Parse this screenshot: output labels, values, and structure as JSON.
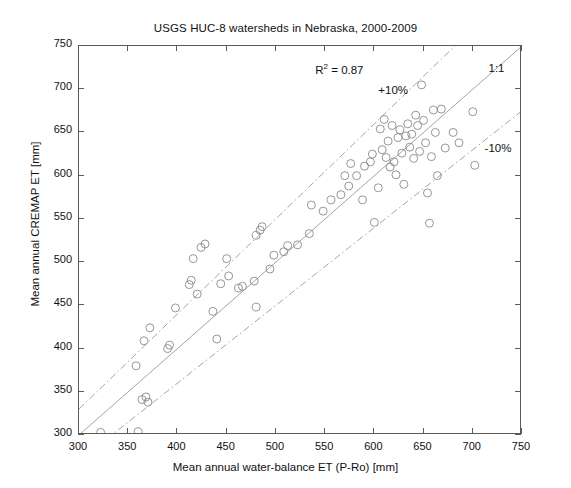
{
  "chart_data": {
    "type": "scatter",
    "title": "USGS HUC-8 watersheds in Nebraska, 2000-2009",
    "xlabel": "Mean annual water-balance ET (P-Ro) [mm]",
    "ylabel": "Mean annual CREMAP ET [mm]",
    "xlim": [
      300,
      750
    ],
    "ylim": [
      300,
      750
    ],
    "xticks": [
      300,
      350,
      400,
      450,
      500,
      550,
      600,
      650,
      700,
      750
    ],
    "yticks": [
      300,
      350,
      400,
      450,
      500,
      550,
      600,
      650,
      700,
      750
    ],
    "grid": false,
    "legend": "none",
    "marker": "open-circle",
    "marker_color": "#8a8a8a",
    "line_color": "#9a9a9a",
    "annotations": [
      {
        "name": "r-squared",
        "text_pre": "R",
        "text_sup": "2",
        "text_post": " = 0.87",
        "x": 540,
        "y": 722
      },
      {
        "name": "plus-ten-percent",
        "text": "+10%",
        "x": 604,
        "y": 697
      },
      {
        "name": "one-to-one",
        "text": "1:1",
        "x": 716,
        "y": 722
      },
      {
        "name": "minus-ten-percent",
        "text": "-10%",
        "x": 712,
        "y": 630
      }
    ],
    "reference_lines": [
      {
        "name": "one-to-one-line",
        "label": "1:1",
        "style": "solid",
        "slope": 1.0,
        "intercept": 0
      },
      {
        "name": "plus-10-percent-line",
        "label": "+10%",
        "style": "dash-dot",
        "slope": 1.1,
        "intercept": 0
      },
      {
        "name": "minus-10-percent-line",
        "label": "-10%",
        "style": "dash-dot",
        "slope": 0.9,
        "intercept": 0
      }
    ],
    "r_squared": 0.87,
    "points": [
      [
        322,
        303
      ],
      [
        360,
        304
      ],
      [
        364,
        341
      ],
      [
        368,
        344
      ],
      [
        370,
        338
      ],
      [
        358,
        380
      ],
      [
        366,
        409
      ],
      [
        372,
        424
      ],
      [
        390,
        400
      ],
      [
        392,
        404
      ],
      [
        398,
        447
      ],
      [
        412,
        474
      ],
      [
        414,
        479
      ],
      [
        420,
        463
      ],
      [
        416,
        504
      ],
      [
        424,
        517
      ],
      [
        428,
        521
      ],
      [
        436,
        443
      ],
      [
        440,
        411
      ],
      [
        444,
        475
      ],
      [
        450,
        504
      ],
      [
        452,
        484
      ],
      [
        462,
        470
      ],
      [
        466,
        472
      ],
      [
        478,
        478
      ],
      [
        480,
        531
      ],
      [
        484,
        537
      ],
      [
        486,
        541
      ],
      [
        480,
        448
      ],
      [
        494,
        492
      ],
      [
        498,
        508
      ],
      [
        508,
        512
      ],
      [
        512,
        519
      ],
      [
        522,
        520
      ],
      [
        534,
        533
      ],
      [
        536,
        566
      ],
      [
        548,
        559
      ],
      [
        556,
        572
      ],
      [
        566,
        578
      ],
      [
        570,
        600
      ],
      [
        574,
        588
      ],
      [
        576,
        614
      ],
      [
        582,
        600
      ],
      [
        588,
        572
      ],
      [
        590,
        611
      ],
      [
        596,
        616
      ],
      [
        598,
        625
      ],
      [
        600,
        546
      ],
      [
        604,
        586
      ],
      [
        606,
        654
      ],
      [
        608,
        630
      ],
      [
        610,
        665
      ],
      [
        612,
        621
      ],
      [
        614,
        640
      ],
      [
        616,
        610
      ],
      [
        618,
        658
      ],
      [
        620,
        616
      ],
      [
        622,
        601
      ],
      [
        624,
        644
      ],
      [
        626,
        653
      ],
      [
        628,
        626
      ],
      [
        630,
        590
      ],
      [
        632,
        646
      ],
      [
        634,
        660
      ],
      [
        636,
        633
      ],
      [
        638,
        648
      ],
      [
        640,
        620
      ],
      [
        642,
        670
      ],
      [
        644,
        658
      ],
      [
        646,
        628
      ],
      [
        648,
        705
      ],
      [
        650,
        664
      ],
      [
        652,
        638
      ],
      [
        654,
        580
      ],
      [
        656,
        545
      ],
      [
        658,
        622
      ],
      [
        660,
        676
      ],
      [
        662,
        650
      ],
      [
        664,
        600
      ],
      [
        668,
        677
      ],
      [
        672,
        632
      ],
      [
        680,
        650
      ],
      [
        686,
        638
      ],
      [
        700,
        674
      ],
      [
        702,
        612
      ]
    ]
  }
}
